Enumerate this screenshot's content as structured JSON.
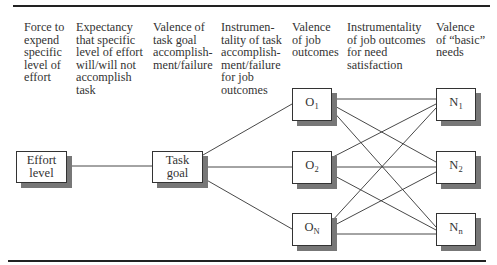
{
  "headers": [
    {
      "id": "force",
      "text": "Force to\nexpend\nspecific\nlevel of\neffort"
    },
    {
      "id": "expectancy",
      "text": "Expectancy\nthat specific\nlevel of effort\nwill/will not\naccomplish\ntask"
    },
    {
      "id": "valence-task",
      "text": "Valence of\ntask goal\naccomplish-\nment/failure"
    },
    {
      "id": "instrumentality-task",
      "text": "Instrumen-\ntality of task\naccomplish-\nment/failure\nfor job\noutcomes"
    },
    {
      "id": "valence-job",
      "text": "Valence\nof job\noutcomes"
    },
    {
      "id": "instrumentality-job",
      "text": "Instrumentality\nof job outcomes\nfor need\nsatisfaction"
    },
    {
      "id": "valence-needs",
      "text": "Valence\nof “basic”\nneeds"
    }
  ],
  "nodes": {
    "effort": {
      "label": "Effort\nlevel"
    },
    "task": {
      "label": "Task\ngoal"
    },
    "o1": {
      "base": "O",
      "sub": "1"
    },
    "o2": {
      "base": "O",
      "sub": "2"
    },
    "on": {
      "base": "O",
      "sub": "N"
    },
    "n1": {
      "base": "N",
      "sub": "1"
    },
    "n2": {
      "base": "N",
      "sub": "2"
    },
    "nn": {
      "base": "N",
      "sub": "n"
    }
  },
  "edges": [
    [
      "effort",
      "task"
    ],
    [
      "task",
      "o1"
    ],
    [
      "task",
      "o2"
    ],
    [
      "task",
      "on"
    ],
    [
      "o1",
      "n1"
    ],
    [
      "o1",
      "n2"
    ],
    [
      "o1",
      "nn"
    ],
    [
      "o2",
      "n1"
    ],
    [
      "o2",
      "n2"
    ],
    [
      "o2",
      "nn"
    ],
    [
      "on",
      "n1"
    ],
    [
      "on",
      "n2"
    ],
    [
      "on",
      "nn"
    ]
  ]
}
